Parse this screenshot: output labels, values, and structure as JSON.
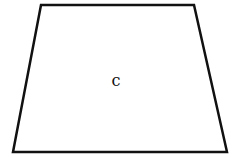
{
  "diagram": {
    "type": "trapezoid",
    "stroke_color": "#111111",
    "fill_color": "#ffffff",
    "stroke_width": 2.5,
    "vertices": {
      "top_left": [
        41,
        5
      ],
      "top_right": [
        194,
        5
      ],
      "bottom_right": [
        227,
        152
      ],
      "bottom_left": [
        13,
        152
      ]
    },
    "label": {
      "text": "c",
      "x": 116,
      "y": 86
    }
  }
}
